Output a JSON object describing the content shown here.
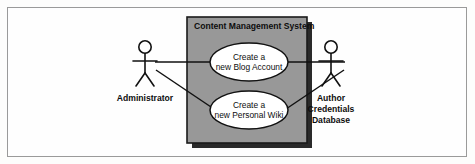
{
  "diagram": {
    "kind": "uml-use-case-diagram",
    "system": {
      "title": "Content Management System",
      "fill_color": "#989898",
      "border_color": "#1b1b1b",
      "shadow_color": "#2a2a2a"
    },
    "use_cases": [
      {
        "id": "create-blog-account",
        "line1": "Create a",
        "line2": "new Blog Account"
      },
      {
        "id": "create-personal-wiki",
        "line1": "Create a",
        "line2": "new Personal Wiki"
      }
    ],
    "actors": [
      {
        "id": "administrator",
        "label_lines": [
          "Administrator"
        ]
      },
      {
        "id": "author-credentials-database",
        "label_lines": [
          "Author",
          "Credentials",
          "Database"
        ]
      }
    ],
    "associations": [
      {
        "from": "administrator",
        "to": "create-blog-account"
      },
      {
        "from": "administrator",
        "to": "create-personal-wiki"
      },
      {
        "from": "author-credentials-database",
        "to": "create-blog-account"
      },
      {
        "from": "author-credentials-database",
        "to": "create-personal-wiki"
      }
    ],
    "frame": {
      "border_color": "#9a9a9a",
      "background_color": "#fefefe"
    }
  }
}
